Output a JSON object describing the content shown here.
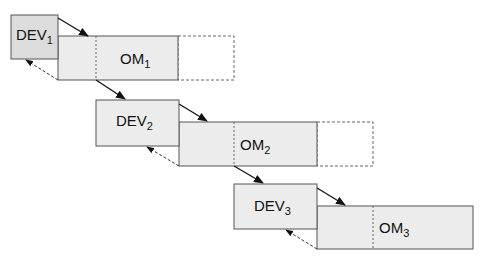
{
  "diagram": {
    "type": "staircase block diagram",
    "stages": [
      {
        "dev": {
          "label": "DEV",
          "sub": "1"
        },
        "om": {
          "label": "OM",
          "sub": "1"
        },
        "has_dashed_extension": true
      },
      {
        "dev": {
          "label": "DEV",
          "sub": "2"
        },
        "om": {
          "label": "OM",
          "sub": "2"
        },
        "has_dashed_extension": true
      },
      {
        "dev": {
          "label": "DEV",
          "sub": "3"
        },
        "om": {
          "label": "OM",
          "sub": "3"
        },
        "has_dashed_extension": false
      }
    ],
    "colors": {
      "box_fill": "#ececec",
      "dev1_fill": "#dcdcdc",
      "stroke": "#555555",
      "arrow": "#111111"
    }
  }
}
